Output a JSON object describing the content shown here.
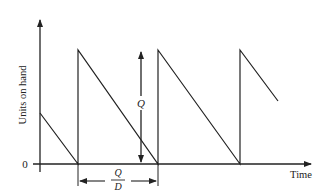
{
  "diagram": {
    "y_axis_label": "Units on hand",
    "x_axis_label": "Time",
    "origin_label": "0",
    "order_quantity_label": "Q",
    "cycle_length_numerator": "Q",
    "cycle_length_denominator": "D",
    "colors": {
      "line": "#222222",
      "background": "#ffffff"
    }
  }
}
